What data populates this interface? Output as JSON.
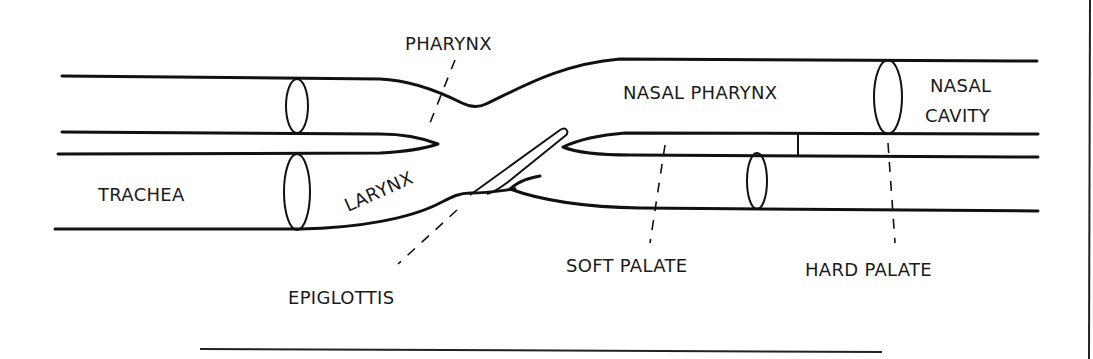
{
  "diagram": {
    "labels": {
      "pharynx": "PHARYNX",
      "nasal_pharynx": "NASAL PHARYNX",
      "nasal_line1": "NASAL",
      "nasal_line2": "CAVITY",
      "trachea": "TRACHEA",
      "larynx": "LARYNX",
      "epiglottis": "EPIGLOTTIS",
      "soft_palate": "SOFT PALATE",
      "hard_palate": "HARD PALATE"
    },
    "colors": {
      "ink": "#111111",
      "background": "#ffffff"
    }
  }
}
